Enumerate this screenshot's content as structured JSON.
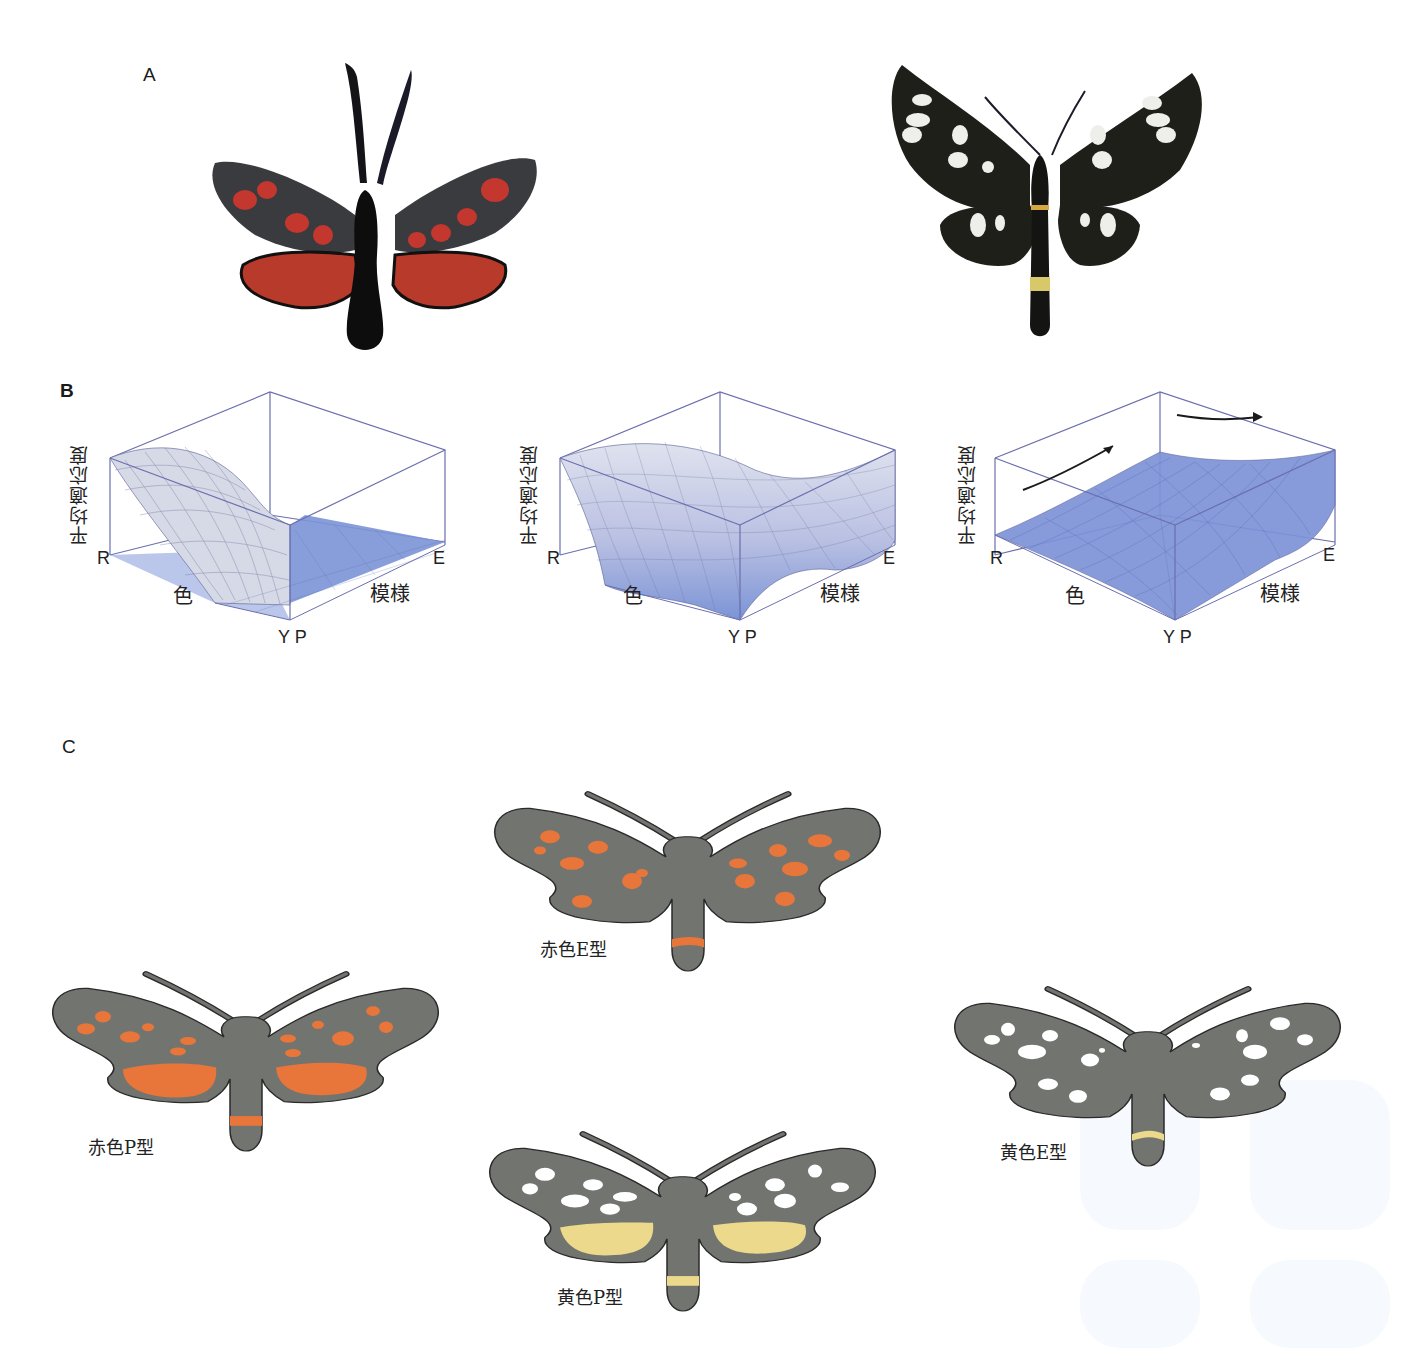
{
  "figure": {
    "panels": {
      "A": {
        "label": "A",
        "photos": [
          {
            "name": "red-moth-photo",
            "description": "Red-spotted black moth specimen (red P-type)",
            "colors": {
              "wing": "#2e2e30",
              "spot": "#c8322a",
              "body": "#111111"
            }
          },
          {
            "name": "white-spot-moth-photo",
            "description": "Black moth with white spots and yellow abdominal band (yellow E-type)",
            "colors": {
              "wing": "#1c1c16",
              "spot": "#f1f1ec",
              "band": "#d8c86a",
              "body": "#151515"
            }
          }
        ]
      },
      "B": {
        "label": "B",
        "plots": [
          {
            "z_label": "平均適応度",
            "x_start": "R",
            "x_label": "色",
            "corner": "Y P",
            "y_label": "模様",
            "y_end": "E",
            "surface": "peak at R-P, drops to flat plane elsewhere"
          },
          {
            "z_label": "平均適応度",
            "x_start": "R",
            "x_label": "色",
            "corner": "Y P",
            "y_label": "模様",
            "y_end": "E",
            "surface": "saddle: high at R-P and Y-E corners"
          },
          {
            "z_label": "平均適応度",
            "x_start": "R",
            "x_label": "色",
            "corner": "Y P",
            "y_label": "模様",
            "y_end": "E",
            "surface": "rising toward Y-E corner with arrows",
            "arrows": 2
          }
        ],
        "colors": {
          "frame": "#6b6fae",
          "surface_high": "#d8dbe8",
          "surface_low": "#7b93d6",
          "grid": "#5a5f95",
          "arrow": "#1a1a1a"
        }
      },
      "C": {
        "label": "C",
        "morphs": [
          {
            "caption": "赤色E型",
            "spot_color": "#e8763a",
            "band_color": "#e8763a",
            "pattern": "E"
          },
          {
            "caption": "赤色P型",
            "spot_color": "#e8763a",
            "band_color": "#e8763a",
            "pattern": "P"
          },
          {
            "caption": "黄色P型",
            "spot_color": "#ffffff",
            "patch_color": "#ecd98c",
            "band_color": "#ecd98c",
            "pattern": "P"
          },
          {
            "caption": "黄色E型",
            "spot_color": "#ffffff",
            "band_color": "#ecd98c",
            "pattern": "E"
          }
        ],
        "colors": {
          "wing": "#727470",
          "outline": "#2a2a2a"
        }
      }
    }
  }
}
